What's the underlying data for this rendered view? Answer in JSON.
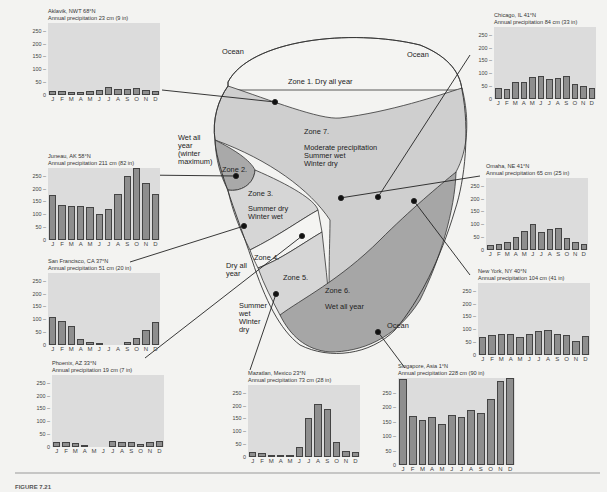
{
  "figure": {
    "caption": "FIGURE 7.21",
    "y_ticks": [
      "250",
      "200",
      "150",
      "100",
      "50",
      "0"
    ],
    "months": [
      "J",
      "F",
      "M",
      "A",
      "M",
      "J",
      "J",
      "A",
      "S",
      "O",
      "N",
      "D"
    ]
  },
  "map": {
    "labels": {
      "ocean_top_left": "Ocean",
      "ocean_top_right": "Ocean",
      "ocean_bottom_right": "Ocean",
      "zone1": "Zone 1.  Dry all year",
      "zone7_title": "Zone 7.",
      "zone7_line1": "Moderate precipitation",
      "zone7_line2": "Summer wet",
      "zone7_line3": "Winter dry",
      "zone2": "Zone 2.",
      "zone2_desc_1": "Wet all",
      "zone2_desc_2": "year",
      "zone2_desc_3": "(winter",
      "zone2_desc_4": "maximum)",
      "zone3_title": "Zone 3.",
      "zone3_line1": "Summer dry",
      "zone3_line2": "Winter wet",
      "zone4": "Zone 4.",
      "zone4_desc_1": "Dry all",
      "zone4_desc_2": "year",
      "zone5": "Zone 5.",
      "zone5_desc_1": "Summer",
      "zone5_desc_2": "wet",
      "zone5_desc_3": "Winter",
      "zone5_desc_4": "dry",
      "zone6_title": "Zone 6.",
      "zone6_desc": "Wet all year"
    },
    "colors": {
      "zone1": "#f4f4f2",
      "zone7": "#cfcfcf",
      "zone2": "#a9a9a9",
      "zone3": "#d6d6d6",
      "zone4": "#f4f4f2",
      "zone5": "#d6d6d6",
      "zone6": "#a6a6a6"
    }
  },
  "chart_data": [
    {
      "type": "bar",
      "title": "Aklavik, NWT 68°N",
      "subtitle": "Annual precipitation 23 cm (9 in)",
      "categories": [
        "J",
        "F",
        "M",
        "A",
        "M",
        "J",
        "J",
        "A",
        "S",
        "O",
        "N",
        "D"
      ],
      "values": [
        15,
        15,
        12,
        12,
        15,
        20,
        30,
        25,
        22,
        28,
        18,
        15
      ],
      "ylabel": "mm",
      "ylim": [
        0,
        280
      ]
    },
    {
      "type": "bar",
      "title": "Juneau, AK 58°N",
      "subtitle": "Annual precipitation 211 cm (82 in)",
      "categories": [
        "J",
        "F",
        "M",
        "A",
        "M",
        "J",
        "J",
        "A",
        "S",
        "O",
        "N",
        "D"
      ],
      "values": [
        175,
        138,
        132,
        132,
        128,
        100,
        122,
        178,
        250,
        282,
        222,
        178
      ],
      "ylabel": "mm",
      "ylim": [
        0,
        280
      ]
    },
    {
      "type": "bar",
      "title": "San Francisco, CA 37°N",
      "subtitle": "Annual precipitation 51 cm (20 in)",
      "categories": [
        "J",
        "F",
        "M",
        "A",
        "M",
        "J",
        "J",
        "A",
        "S",
        "O",
        "N",
        "D"
      ],
      "values": [
        110,
        95,
        75,
        25,
        12,
        5,
        0,
        0,
        12,
        28,
        60,
        88
      ],
      "ylabel": "mm",
      "ylim": [
        0,
        280
      ]
    },
    {
      "type": "bar",
      "title": "Phoenix, AZ 33°N",
      "subtitle": "Annual precipitation 19 cm (7 in)",
      "categories": [
        "J",
        "F",
        "M",
        "A",
        "M",
        "J",
        "J",
        "A",
        "S",
        "O",
        "N",
        "D"
      ],
      "values": [
        18,
        20,
        15,
        8,
        0,
        0,
        22,
        20,
        18,
        10,
        18,
        22
      ],
      "ylabel": "mm",
      "ylim": [
        0,
        280
      ]
    },
    {
      "type": "bar",
      "title": "Mazatlan, Mexico 23°N",
      "subtitle": "Annual precipitation 73 cm (28 in)",
      "categories": [
        "J",
        "F",
        "M",
        "A",
        "M",
        "J",
        "J",
        "A",
        "S",
        "O",
        "N",
        "D"
      ],
      "values": [
        20,
        15,
        8,
        8,
        8,
        38,
        152,
        208,
        188,
        60,
        22,
        18
      ],
      "ylabel": "mm",
      "ylim": [
        0,
        280
      ]
    },
    {
      "type": "bar",
      "title": "Chicago, IL 41°N",
      "subtitle": "Annual precipitation 84 cm (33 in)",
      "categories": [
        "J",
        "F",
        "M",
        "A",
        "M",
        "J",
        "J",
        "A",
        "S",
        "O",
        "N",
        "D"
      ],
      "values": [
        42,
        38,
        68,
        65,
        85,
        88,
        78,
        82,
        88,
        58,
        50,
        42
      ],
      "ylabel": "mm",
      "ylim": [
        0,
        280
      ]
    },
    {
      "type": "bar",
      "title": "Omaha, NE 41°N",
      "subtitle": "Annual precipitation 65 cm (25 in)",
      "categories": [
        "J",
        "F",
        "M",
        "A",
        "M",
        "J",
        "J",
        "A",
        "S",
        "O",
        "N",
        "D"
      ],
      "values": [
        18,
        22,
        32,
        50,
        75,
        100,
        72,
        82,
        85,
        45,
        32,
        25
      ],
      "ylabel": "mm",
      "ylim": [
        0,
        280
      ]
    },
    {
      "type": "bar",
      "title": "New York, NY 40°N",
      "subtitle": "Annual precipitation 104 cm (41 in)",
      "categories": [
        "J",
        "F",
        "M",
        "A",
        "M",
        "J",
        "J",
        "A",
        "S",
        "O",
        "N",
        "D"
      ],
      "values": [
        72,
        78,
        82,
        80,
        70,
        82,
        92,
        98,
        82,
        78,
        55,
        75
      ],
      "ylabel": "mm",
      "ylim": [
        0,
        280
      ]
    },
    {
      "type": "bar",
      "title": "Singapore, Asia 1°N",
      "subtitle": "Annual precipitation 228 cm (90 in)",
      "categories": [
        "J",
        "F",
        "M",
        "A",
        "M",
        "J",
        "J",
        "A",
        "S",
        "O",
        "N",
        "D"
      ],
      "values": [
        295,
        170,
        155,
        165,
        142,
        172,
        165,
        190,
        178,
        228,
        290,
        300
      ],
      "ylabel": "mm",
      "ylim": [
        0,
        300
      ]
    }
  ]
}
